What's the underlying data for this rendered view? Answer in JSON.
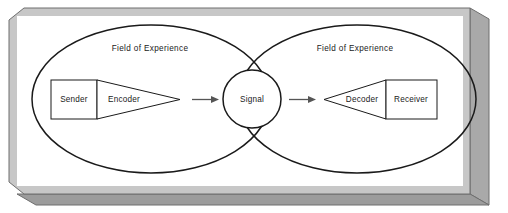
{
  "diagram": {
    "type": "venn-process-diagram",
    "frame": {
      "style": "3d-beveled-slab",
      "face_color": "#c6c6c6",
      "side_color": "#a8a8a8",
      "bottom_color": "#9a9a9a",
      "edge_color": "#6e6e6e",
      "panel_color": "#ffffff"
    },
    "ellipses": [
      {
        "id": "left-field",
        "label": "Field of Experience",
        "cx": 151,
        "cy": 99,
        "rx": 119,
        "ry": 74
      },
      {
        "id": "right-field",
        "label": "Field of Experience",
        "cx": 357,
        "cy": 99,
        "rx": 119,
        "ry": 74
      }
    ],
    "center_node": {
      "id": "signal",
      "label": "Signal",
      "shape": "circle",
      "cx": 252,
      "cy": 99,
      "r": 29
    },
    "nodes": [
      {
        "id": "sender",
        "label": "Sender",
        "shape": "rectangle",
        "side": "left"
      },
      {
        "id": "encoder",
        "label": "Encoder",
        "shape": "triangle",
        "side": "left"
      },
      {
        "id": "decoder",
        "label": "Decoder",
        "shape": "triangle",
        "side": "right"
      },
      {
        "id": "receiver",
        "label": "Receiver",
        "shape": "rectangle",
        "side": "right"
      }
    ],
    "arrows": [
      {
        "id": "encoder-to-signal",
        "from": "encoder",
        "to": "signal",
        "direction": "right"
      },
      {
        "id": "signal-to-decoder",
        "from": "signal",
        "to": "decoder",
        "direction": "right"
      }
    ],
    "colors": {
      "stroke": "#1a1a1a",
      "fill": "#ffffff",
      "background": "#c6c6c6",
      "arrow": "#555555"
    }
  }
}
